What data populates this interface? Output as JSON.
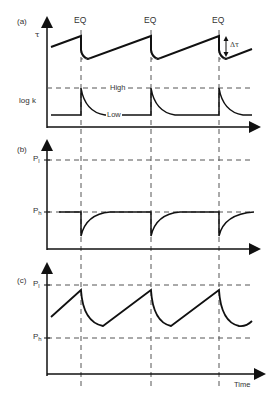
{
  "figure": {
    "panels": [
      {
        "id": "a",
        "label": "(a)",
        "y_labels": [
          "τ",
          "log k"
        ],
        "event_labels": [
          "EQ",
          "EQ",
          "EQ"
        ],
        "annotations": [
          "Δτ",
          "High",
          "Low"
        ]
      },
      {
        "id": "b",
        "label": "(b)",
        "y_levels": [
          {
            "name": "P",
            "sub": "l"
          },
          {
            "name": "P",
            "sub": "h"
          }
        ]
      },
      {
        "id": "c",
        "label": "(c)",
        "y_levels": [
          {
            "name": "P",
            "sub": "l"
          },
          {
            "name": "P",
            "sub": "h"
          }
        ],
        "x_label": "Time"
      }
    ]
  },
  "labels": {
    "panel_a": "(a)",
    "panel_b": "(b)",
    "panel_c": "(c)",
    "eq1": "EQ",
    "eq2": "EQ",
    "eq3": "EQ",
    "tau": "τ",
    "delta_tau": "Δτ",
    "logk": "log k",
    "high": "High",
    "low": "Low",
    "p": "P",
    "sub_l": "l",
    "sub_h": "h",
    "time": "Time"
  },
  "colors": {
    "line": "#1a1a1a",
    "dash": "#555555",
    "text": "#333333"
  }
}
